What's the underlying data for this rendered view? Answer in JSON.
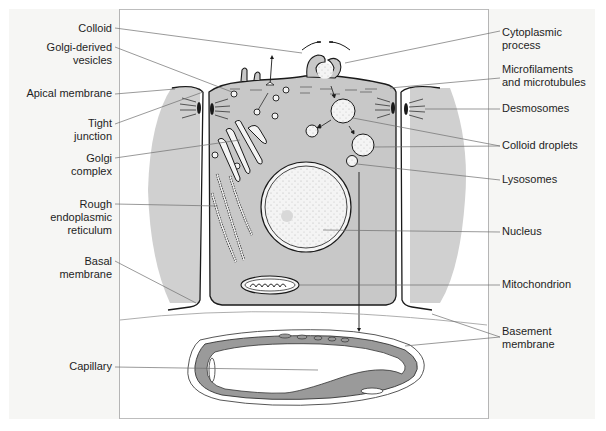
{
  "figure": {
    "colors": {
      "cytoplasm": "#c8c8c8",
      "neighbor_cells": "#d0d0d0",
      "capillary_wall": "#9a9a9a",
      "line": "#1a1a1a",
      "leader": "#6e6e6e",
      "panel_bg": "#f6f6f4"
    }
  },
  "labels_left": [
    {
      "id": "colloid",
      "line1": "Colloid",
      "line2": ""
    },
    {
      "id": "golgi-vesicles",
      "line1": "Golgi-derived",
      "line2": "vesicles"
    },
    {
      "id": "apical-membrane",
      "line1": "Apical membrane",
      "line2": ""
    },
    {
      "id": "tight-junction",
      "line1": "Tight",
      "line2": "junction"
    },
    {
      "id": "golgi-complex",
      "line1": "Golgi",
      "line2": "complex"
    },
    {
      "id": "rough-er",
      "line1": "Rough",
      "line2": "endoplasmic",
      "line3": "reticulum"
    },
    {
      "id": "basal-membrane",
      "line1": "Basal",
      "line2": "membrane"
    },
    {
      "id": "capillary",
      "line1": "Capillary",
      "line2": ""
    }
  ],
  "labels_right": [
    {
      "id": "cytoplasmic-process",
      "line1": "Cytoplasmic",
      "line2": "process"
    },
    {
      "id": "microfilaments",
      "line1": "Microfilaments",
      "line2": "and microtubules"
    },
    {
      "id": "desmosomes",
      "line1": "Desmosomes",
      "line2": ""
    },
    {
      "id": "colloid-droplets",
      "line1": "Colloid droplets",
      "line2": ""
    },
    {
      "id": "lysosomes",
      "line1": "Lysosomes",
      "line2": ""
    },
    {
      "id": "nucleus",
      "line1": "Nucleus",
      "line2": ""
    },
    {
      "id": "mitochondrion",
      "line1": "Mitochondrion",
      "line2": ""
    },
    {
      "id": "basement-membrane",
      "line1": "Basement",
      "line2": "membrane"
    }
  ]
}
